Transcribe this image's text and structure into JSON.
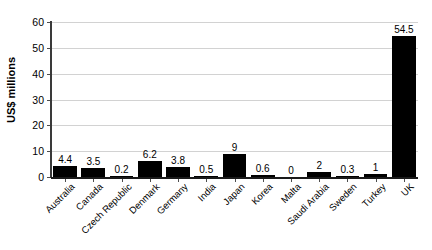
{
  "chart_data": {
    "type": "bar",
    "title": "",
    "subtitle": "",
    "xlabel": "",
    "ylabel": "US$ millions",
    "ylim": [
      0,
      60
    ],
    "yticks": [
      0,
      10,
      20,
      30,
      40,
      50,
      60
    ],
    "ytick_labels": [
      "0",
      "10",
      "20",
      "30",
      "40",
      "50",
      "60"
    ],
    "grid": "horizontal",
    "legend": "none",
    "bar_color": "#000000",
    "grid_color": "#d2d2d2",
    "axis_color": "#1a1a1a",
    "categories": [
      "Australia",
      "Canada",
      "Czech Republic",
      "Denmark",
      "Germany",
      "India",
      "Japan",
      "Korea",
      "Malta",
      "Saudi Arabia",
      "Sweden",
      "Turkey",
      "UK"
    ],
    "values": [
      4.4,
      3.5,
      0.2,
      6.2,
      3.8,
      0.5,
      9,
      0.6,
      0,
      2,
      0.3,
      1,
      54.5
    ],
    "data_labels": [
      "4.4",
      "3.5",
      "0.2",
      "6.2",
      "3.8",
      "0.5",
      "9",
      "0.6",
      "0",
      "2",
      "0.3",
      "1",
      "54.5"
    ]
  }
}
